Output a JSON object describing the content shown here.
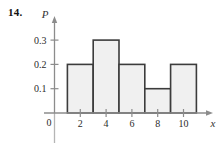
{
  "figure": {
    "problem_number": "14.",
    "y_axis_label": "P",
    "x_axis_label": "x",
    "origin_label": "0"
  },
  "chart_data": {
    "type": "bar",
    "title": "",
    "subtitle": "",
    "xlabel": "x",
    "ylabel": "P",
    "grid": false,
    "legend": null,
    "xlim": [
      0,
      12.5
    ],
    "ylim": [
      0,
      0.35
    ],
    "x_tick_labels": [
      "2",
      "4",
      "6",
      "8",
      "10"
    ],
    "x_tick_values": [
      2,
      4,
      6,
      8,
      10
    ],
    "y_tick_labels": [
      "0.1",
      "0.2",
      "0.3"
    ],
    "y_tick_values": [
      0.1,
      0.2,
      0.3
    ],
    "bin_edges": [
      1,
      3,
      5,
      7,
      9,
      11
    ],
    "categories": [
      "1-3",
      "3-5",
      "5-7",
      "7-9",
      "9-11"
    ],
    "values": [
      0.2,
      0.3,
      0.2,
      0.1,
      0.2
    ],
    "bar_fill_color": "#f0f0f0",
    "bar_edge_color": "#3c3c3c",
    "axis_color": "#8c8c8c"
  }
}
